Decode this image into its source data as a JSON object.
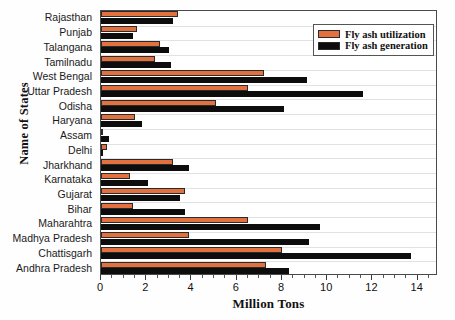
{
  "chart_data": {
    "type": "bar",
    "orientation": "horizontal",
    "title": "",
    "xlabel": "Million Tons",
    "ylabel": "Name of States",
    "xlim": [
      0,
      14.9
    ],
    "xticks": [
      0,
      2,
      4,
      6,
      8,
      10,
      12,
      14
    ],
    "xticklabels": [
      "0",
      "2",
      "4",
      "6",
      "8",
      "10",
      "12",
      "14"
    ],
    "grid": true,
    "grid_axis": "y",
    "legend_position": "top-right",
    "categories": [
      "Rajasthan",
      "Punjab",
      "Talangana",
      "Tamilnadu",
      "West Bengal",
      "Uttar Pradesh",
      "Odisha",
      "Haryana",
      "Assam",
      "Delhi",
      "Jharkhand",
      "Karnataka",
      "Gujarat",
      "Bihar",
      "Maharahtra",
      "Madhya Pradesh",
      "Chattisgarh",
      "Andhra Pradesh"
    ],
    "series": [
      {
        "name": "Fly ash utilization",
        "color": "#e2713f",
        "values": [
          3.4,
          1.6,
          2.6,
          2.4,
          7.2,
          6.5,
          5.1,
          1.5,
          0.05,
          0.25,
          3.2,
          1.3,
          3.7,
          1.4,
          6.5,
          3.9,
          8.0,
          7.3
        ]
      },
      {
        "name": "Fly ash generation",
        "color": "#0d0d0d",
        "values": [
          3.2,
          1.4,
          3.0,
          3.1,
          9.1,
          11.6,
          8.1,
          1.8,
          0.35,
          0.1,
          3.9,
          2.1,
          3.5,
          3.7,
          9.7,
          9.2,
          13.7,
          8.3
        ]
      }
    ]
  },
  "legend": {
    "items": [
      {
        "label": "Fly ash utilization",
        "color": "#e2713f"
      },
      {
        "label": "Fly ash generation",
        "color": "#0d0d0d"
      }
    ]
  },
  "axis": {
    "x_title": "Million Tons",
    "y_title": "Name of States"
  }
}
